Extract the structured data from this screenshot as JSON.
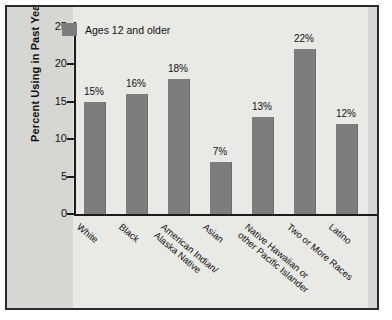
{
  "chart_data": {
    "type": "bar",
    "title": "",
    "xlabel": "",
    "ylabel": "Percent Using in Past Year",
    "ylim": [
      0,
      25
    ],
    "yticks": [
      0,
      5,
      10,
      15,
      20,
      25
    ],
    "grid": false,
    "legend_position": "top-left",
    "categories": [
      "White",
      "American Indian/|Alaska Native",
      "Black",
      "Asian",
      "Native Hawaiian or|other Pacific Islander",
      "Two or More Races",
      "Latino"
    ],
    "categories_ordered": [
      {
        "line1": "White",
        "line2": ""
      },
      {
        "line1": "Black",
        "line2": ""
      },
      {
        "line1": "American Indian/",
        "line2": "Alaska Native"
      },
      {
        "line1": "Asian",
        "line2": ""
      },
      {
        "line1": "Native Hawaiian or",
        "line2": "other Pacific Islander"
      },
      {
        "line1": "Two or More Races",
        "line2": ""
      },
      {
        "line1": "Latino",
        "line2": ""
      }
    ],
    "series": [
      {
        "name": "Ages 12 and older",
        "values": [
          15,
          16,
          18,
          7,
          13,
          22,
          12
        ],
        "value_labels": [
          "15%",
          "16%",
          "18%",
          "7%",
          "13%",
          "22%",
          "12%"
        ],
        "color": "#7d7d7d"
      }
    ]
  },
  "legend": {
    "label": "Ages 12 and older"
  },
  "axis": {
    "y_label": "Percent Using in Past Year",
    "y_tick_labels": [
      "25",
      "20",
      "15",
      "10",
      "5",
      "0"
    ]
  },
  "colors": {
    "bar": "#7d7d7d",
    "background": "#d6d6d3",
    "band": "#e9e9e6",
    "axis": "#1b1b1b",
    "frame": "#2a2a2a"
  }
}
